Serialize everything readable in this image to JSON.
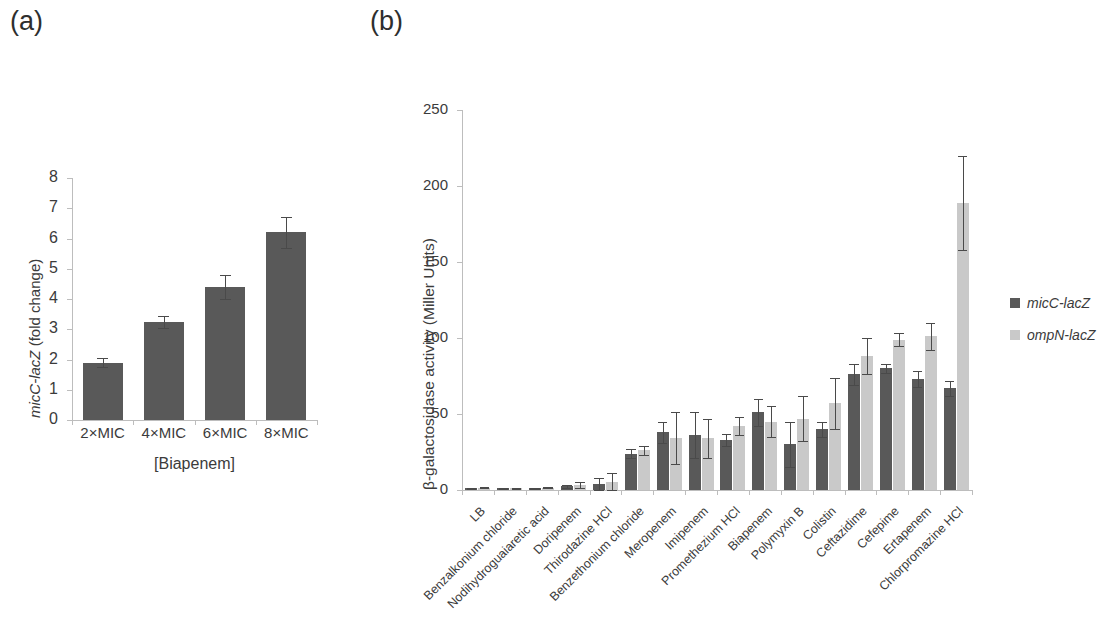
{
  "figure": {
    "panel_a_letter": "(a)",
    "panel_b_letter": "(b)"
  },
  "panel_a": {
    "ylabel_italic": "micC-lacZ",
    "ylabel_rest": " (fold change)",
    "xlabel": "[Biapenem]"
  },
  "panel_b": {
    "ylabel": "β-galactosidase activity (Miller Units)",
    "legend": [
      {
        "label": "micC-lacZ",
        "color": "#595959",
        "swatch_name": "legend-swatch-micc"
      },
      {
        "label": "ompN-lacZ",
        "color": "#c9c9c9",
        "swatch_name": "legend-swatch-ompn"
      }
    ]
  },
  "colors": {
    "dark_bar": "#595959",
    "light_bar": "#c9c9c9",
    "axis": "#bdbdbd",
    "text": "#3b3b3b"
  },
  "chart_data": [
    {
      "type": "bar",
      "panel": "(a)",
      "title": "",
      "xlabel": "[Biapenem]",
      "ylabel": "micC-lacZ (fold change)",
      "ylim": [
        0,
        8
      ],
      "yticks": [
        0,
        1,
        2,
        3,
        4,
        5,
        6,
        7,
        8
      ],
      "grid": false,
      "legend": "none",
      "categories": [
        "2×MIC",
        "4×MIC",
        "6×MIC",
        "8×MIC"
      ],
      "series": [
        {
          "name": "micC-lacZ",
          "color": "#595959",
          "values": [
            1.9,
            3.25,
            4.4,
            6.2
          ],
          "errors": [
            0.15,
            0.2,
            0.4,
            0.5
          ]
        }
      ]
    },
    {
      "type": "bar",
      "panel": "(b)",
      "title": "",
      "xlabel": "",
      "ylabel": "β-galactosidase activity (Miller Units)",
      "ylim": [
        0,
        250
      ],
      "yticks": [
        0,
        50,
        100,
        150,
        200,
        250
      ],
      "grid": false,
      "legend": "right",
      "categories": [
        "LB",
        "Benzalkonium chloride",
        "Nodihydroguaiaretic acid",
        "Doripenem",
        "Thirodazine HCl",
        "Benzethonium chloride",
        "Meropenem",
        "Imipenem",
        "Promethezium HCl",
        "Biapenem",
        "Polymyxin B",
        "Colistin",
        "Ceftazidime",
        "Cefepime",
        "Ertapenem",
        "Chlorpromazine HCl"
      ],
      "series": [
        {
          "name": "micC-lacZ",
          "color": "#595959",
          "values": [
            1,
            1,
            1,
            2.5,
            4,
            24,
            38,
            36,
            33,
            51,
            30,
            40,
            76,
            80,
            73,
            67
          ],
          "errors": [
            0.5,
            0.5,
            0.5,
            1,
            4,
            3,
            7,
            15,
            4,
            9,
            15,
            5,
            7,
            3,
            5,
            5
          ]
        },
        {
          "name": "ompN-lacZ",
          "color": "#c9c9c9",
          "values": [
            1.5,
            1,
            1.5,
            3.5,
            5,
            26,
            34,
            34,
            42,
            45,
            47,
            57,
            88,
            99,
            101,
            189
          ],
          "errors": [
            0.5,
            0.5,
            0.5,
            2,
            6,
            3,
            17,
            13,
            6,
            10,
            15,
            17,
            12,
            4,
            9,
            31
          ]
        }
      ]
    }
  ]
}
